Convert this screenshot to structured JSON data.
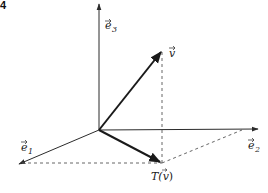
{
  "figure": {
    "number_fragment": "4",
    "labels": {
      "e1": "e",
      "e1_sub": "1",
      "e2": "e",
      "e2_sub": "2",
      "e3": "e",
      "e3_sub": "3",
      "v": "v",
      "Tv_prefix": "T(",
      "Tv_var": "v",
      "Tv_suffix": ")"
    }
  },
  "colors": {
    "stroke": "#2b2b2b",
    "dashed": "#555555"
  }
}
